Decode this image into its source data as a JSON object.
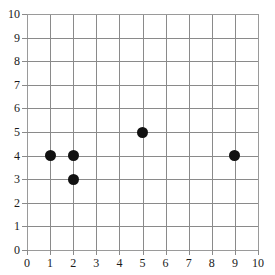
{
  "chart_data": {
    "type": "scatter",
    "title": "",
    "subtitle": "",
    "xlabel": "",
    "ylabel": "",
    "xlim": [
      0,
      10
    ],
    "ylim": [
      0,
      10
    ],
    "xticks": [
      "0",
      "1",
      "2",
      "3",
      "4",
      "5",
      "6",
      "7",
      "8",
      "9",
      "10"
    ],
    "yticks": [
      "0",
      "1",
      "2",
      "3",
      "4",
      "5",
      "6",
      "7",
      "8",
      "9",
      "10"
    ],
    "grid": true,
    "legend": false,
    "legend_position": "none",
    "marker": "filled-circle",
    "marker_color": "#111111",
    "grid_color": "#8a8a8a",
    "background_color": "#ffffff",
    "points": [
      {
        "x": 1,
        "y": 4,
        "label": "(1, 4)"
      },
      {
        "x": 2,
        "y": 4,
        "label": "(2, 4)"
      },
      {
        "x": 2,
        "y": 3,
        "label": "(2, 3)"
      },
      {
        "x": 5,
        "y": 5,
        "label": "(5, 5)"
      },
      {
        "x": 9,
        "y": 4,
        "label": "(9, 4)"
      }
    ]
  }
}
